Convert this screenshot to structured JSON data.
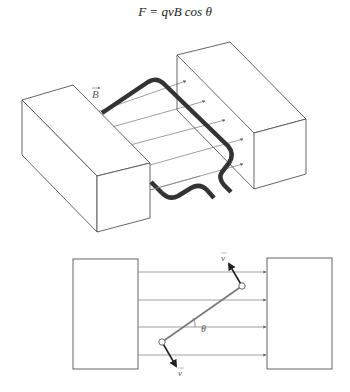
{
  "equation": {
    "text": "F = qvB cos θ"
  },
  "top_figure": {
    "field_label": "B⃗",
    "field_label_plain": "B",
    "field_line_count": 5,
    "description": "Rectangular current loop between two magnet poles in a uniform magnetic field"
  },
  "bottom_figure": {
    "angle_label": "θ",
    "velocity_label_top": "v⃗",
    "velocity_label_bottom": "v⃗",
    "field_line_count": 4,
    "description": "Side view of loop at angle θ to field lines with velocity vectors at ends"
  },
  "colors": {
    "outline": "#555555",
    "field_line": "#777777",
    "coil": "#333333",
    "label": "#666666"
  }
}
